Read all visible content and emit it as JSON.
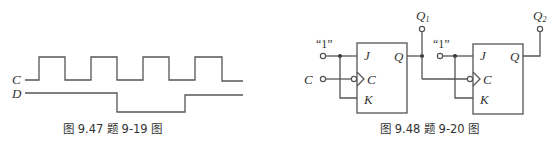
{
  "figure_left": {
    "caption": "图 9.47   题 9-19 图",
    "signals": [
      {
        "name": "C",
        "label": "C",
        "type": "clock",
        "pulses": 4
      },
      {
        "name": "D",
        "label": "D",
        "type": "data",
        "transitions": [
          "high-to-low after 2nd clock falling edge",
          "low-to-high between 3rd falling edge and 4th rising edge"
        ]
      }
    ]
  },
  "figure_right": {
    "caption": "图 9.48   题 9-20 图",
    "flip_flops": [
      {
        "id": "FF1",
        "pins": {
          "j": "J",
          "k": "K",
          "clock": "C",
          "q": "Q"
        },
        "input_const": "“1”",
        "clock_input": "C",
        "output_label": "Q",
        "output_sub": "1"
      },
      {
        "id": "FF2",
        "pins": {
          "j": "J",
          "k": "K",
          "clock": "C",
          "q": "Q"
        },
        "input_const": "“1”",
        "clock_input": "Q1",
        "output_label": "Q",
        "output_sub": "2"
      }
    ],
    "clock_input_label": "C"
  }
}
